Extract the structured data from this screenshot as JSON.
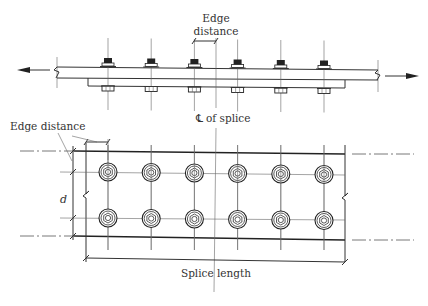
{
  "diagram": {
    "bolt_columns": 6,
    "bolt_rows": 2,
    "labels": {
      "edge_distance_top_line1": "Edge",
      "edge_distance_top_line2": "distance",
      "centerline": "of splice",
      "centerline_symbol": "℄",
      "edge_distance_plan": "Edge distance",
      "gauge": "d",
      "splice_length": "Splice length"
    },
    "icons": {
      "left_load_arrow": "arrow-left",
      "right_load_arrow": "arrow-right",
      "bolt_head": "hex-bolt-elevation",
      "bolt_plan": "hex-bolt-plan"
    }
  }
}
